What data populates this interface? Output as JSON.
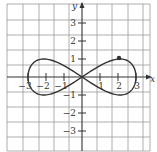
{
  "chart_data": {
    "type": "line",
    "title": "",
    "xlabel": "x",
    "ylabel": "y",
    "xlim": [
      -4.2,
      4.0
    ],
    "ylim": [
      -4.1,
      4.1
    ],
    "grid": true,
    "x_ticks": [
      -3,
      -2,
      -1,
      1,
      2,
      3
    ],
    "y_ticks": [
      3,
      2,
      1,
      -1,
      -2,
      -3
    ],
    "x_tick_labels": [
      "−3",
      "−2",
      "−1",
      "1",
      "2",
      "3"
    ],
    "y_tick_labels": [
      "3",
      "2",
      "1",
      "−1",
      "−2",
      "−3"
    ],
    "series": [
      {
        "name": "figure-eight curve",
        "description": "closed parametric curve x = 3cos t, y = sin 2t",
        "points": [
          [
            3,
            0
          ],
          [
            2.77,
            0.71
          ],
          [
            2.12,
            1.0
          ],
          [
            1.15,
            0.71
          ],
          [
            0,
            0
          ],
          [
            -1.15,
            -0.71
          ],
          [
            -2.12,
            -1.0
          ],
          [
            -2.77,
            -0.71
          ],
          [
            -3,
            0
          ],
          [
            -2.77,
            0.71
          ],
          [
            -2.12,
            1.0
          ],
          [
            -1.15,
            0.71
          ],
          [
            0,
            0
          ],
          [
            1.15,
            -0.71
          ],
          [
            2.12,
            -1.0
          ],
          [
            2.77,
            -0.71
          ],
          [
            3,
            0
          ]
        ]
      }
    ],
    "annotations": [
      {
        "type": "point",
        "x": 2,
        "y": 1,
        "label": ""
      }
    ]
  },
  "colors": {
    "curve": "#333333",
    "grid": "#9a9a9a",
    "axis": "#333333",
    "background": "#ffffff"
  }
}
